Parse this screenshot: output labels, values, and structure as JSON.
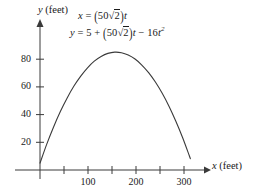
{
  "figure": {
    "title": "",
    "background_color": "#ffffff",
    "curve_color": "#3a3a3a",
    "axis_color": "#3a3a3a",
    "text_color": "#1a1a1a"
  },
  "equations": {
    "eq_x": {
      "lhs": "x",
      "eq": "=",
      "coefficient": "50",
      "radical": "2",
      "variable": "t",
      "plain": "x = (50√2)t"
    },
    "eq_y": {
      "lhs": "y",
      "eq": "=",
      "constant": "5",
      "plus": "+",
      "coefficient": "50",
      "radical": "2",
      "variable": "t",
      "minus": "−",
      "quadratic_coefficient": "16",
      "quadratic_variable": "t",
      "exponent": "2",
      "plain": "y = 5 + (50√2)t − 16t²"
    }
  },
  "axes": {
    "x_label": "x (feet)",
    "y_label": "y (feet)",
    "x_label_italic": "x",
    "y_label_italic": "y",
    "x_label_unit": "(feet)",
    "y_label_unit": "(feet)",
    "x_ticks_labeled": [
      "100",
      "200",
      "300"
    ],
    "y_ticks_labeled": [
      "20",
      "40",
      "60",
      "80"
    ]
  },
  "chart_data": {
    "type": "line",
    "title": "",
    "subtitle": "",
    "xlabel": "x (feet)",
    "ylabel": "y (feet)",
    "xlim": [
      0,
      340
    ],
    "ylim": [
      0,
      95
    ],
    "grid": false,
    "legend": null,
    "annotations": [
      "x = (50√2)t",
      "y = 5 + (50√2)t − 16t²"
    ],
    "xticks_major": [
      100,
      200,
      300
    ],
    "xticks_minor": [
      50,
      150,
      250
    ],
    "yticks_major": [
      20,
      40,
      60,
      80
    ],
    "series": [
      {
        "name": "projectile-trajectory",
        "x": [
          0,
          14.1,
          28.3,
          42.4,
          56.6,
          70.7,
          84.9,
          99.0,
          113.1,
          127.3,
          141.4,
          155.6,
          169.7,
          183.8,
          198.0,
          212.1,
          226.3,
          240.4,
          254.6,
          268.7,
          282.8,
          297.0,
          311.1,
          313.2
        ],
        "y": [
          5.0,
          18.7,
          31.1,
          42.2,
          52.0,
          60.6,
          67.8,
          73.8,
          78.6,
          82.0,
          84.2,
          85.1,
          84.7,
          83.0,
          80.1,
          75.8,
          70.3,
          63.5,
          55.4,
          46.1,
          35.4,
          23.5,
          10.3,
          8.2
        ]
      }
    ]
  }
}
